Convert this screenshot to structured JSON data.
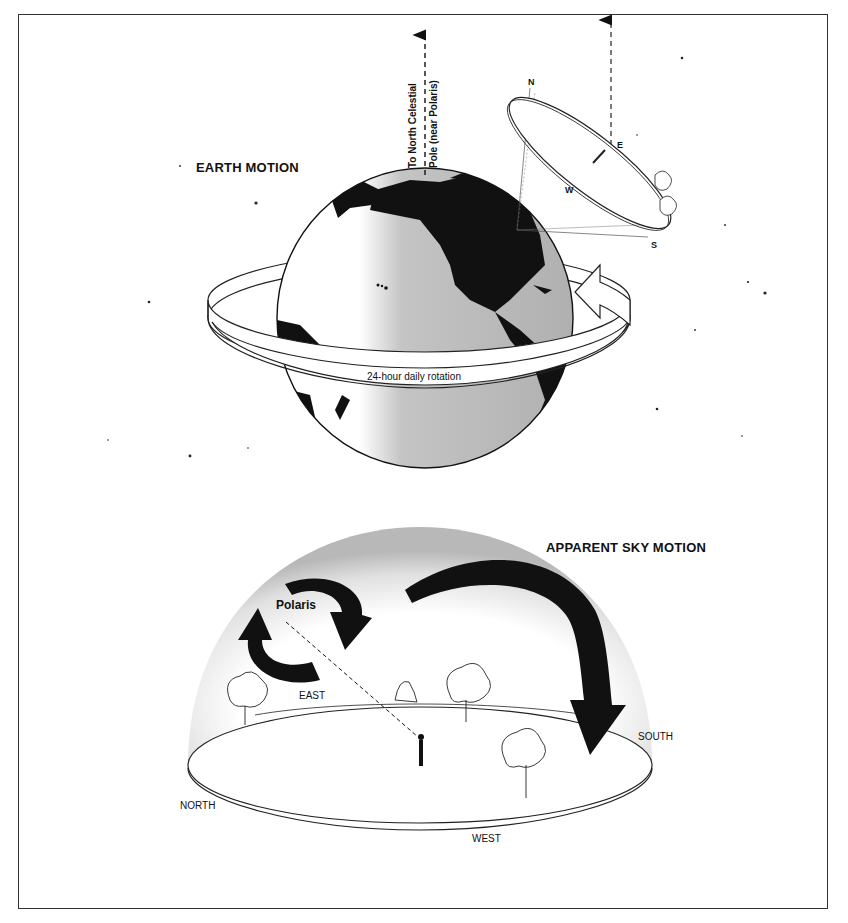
{
  "earth_motion": {
    "title": "EARTH MOTION",
    "pole_label_line1": "To North Celestial",
    "pole_label_line2": "Pole (near Polaris)",
    "rotation_label": "24-hour daily rotation",
    "horizon_plane": {
      "n": "N",
      "e": "E",
      "w": "W",
      "s": "S"
    }
  },
  "sky_motion": {
    "title": "APPARENT SKY MOTION",
    "star_label": "Polaris",
    "directions": {
      "east": "EAST",
      "south": "SOUTH",
      "north": "NORTH",
      "west": "WEST"
    }
  },
  "colors": {
    "ink": "#111111",
    "frame": "#333333",
    "ocean_gray": "#b8b8b8",
    "dome_gray": "#c8c8c8"
  }
}
